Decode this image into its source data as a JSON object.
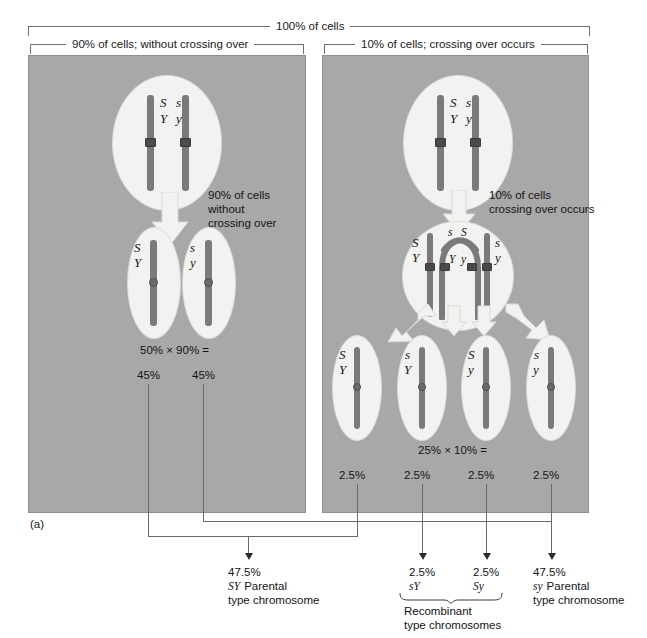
{
  "figure": {
    "label": "(a)",
    "top_bracket": "100% of cells",
    "left_bracket": "90% of cells; without crossing over",
    "right_bracket": "10% of cells; crossing over occurs"
  },
  "left_panel": {
    "parent_cell": {
      "chromosome_left": {
        "top_allele": "S",
        "bottom_allele": "Y"
      },
      "chromosome_right": {
        "top_allele": "s",
        "bottom_allele": "y"
      }
    },
    "arrow_caption": [
      "90% of cells",
      "without",
      "crossing over"
    ],
    "daughter_cells": [
      {
        "top_allele": "S",
        "bottom_allele": "Y",
        "percent": "45%"
      },
      {
        "top_allele": "s",
        "bottom_allele": "y",
        "percent": "45%"
      }
    ],
    "calculation": "50% × 90% ="
  },
  "right_panel": {
    "parent_cell": {
      "chromosome_left": {
        "top_allele": "S",
        "bottom_allele": "Y"
      },
      "chromosome_right": {
        "top_allele": "s",
        "bottom_allele": "y"
      }
    },
    "arrow_caption": [
      "10% of cells",
      "crossing over occurs"
    ],
    "crossover_cell": {
      "outer_left": {
        "top_allele": "S",
        "bottom_allele": "Y"
      },
      "inner_left_top": "s",
      "inner_right_top": "S",
      "inner_left_bottom": "Y",
      "inner_right_bottom": "y",
      "outer_right": {
        "top_allele": "s",
        "bottom_allele": "y"
      }
    },
    "daughter_cells": [
      {
        "top_allele": "S",
        "bottom_allele": "Y",
        "percent": "2.5%"
      },
      {
        "top_allele": "s",
        "bottom_allele": "Y",
        "percent": "2.5%"
      },
      {
        "top_allele": "S",
        "bottom_allele": "y",
        "percent": "2.5%"
      },
      {
        "top_allele": "s",
        "bottom_allele": "y",
        "percent": "2.5%"
      }
    ],
    "calculation": "25% × 10% ="
  },
  "results": [
    {
      "percent": "47.5%",
      "genotype": "SY",
      "line1_rest": "Parental",
      "line2": "type chromosome"
    },
    {
      "percent": "2.5%",
      "genotype": "sY"
    },
    {
      "percent": "2.5%",
      "genotype": "Sy"
    },
    {
      "percent": "47.5%",
      "genotype": "sy",
      "line1_rest": "Parental",
      "line2": "type chromosome"
    }
  ],
  "recombinant_label": {
    "line1": "Recombinant",
    "line2": "type chromosomes"
  },
  "colors": {
    "panel_gray": "#a8a8a8",
    "cell_white": "#f2f2f0",
    "chromosome_gray": "#7a7a7a",
    "arrow_white": "#f2f2f0",
    "line_gray": "#6a6a6a",
    "text_black": "#141414"
  }
}
